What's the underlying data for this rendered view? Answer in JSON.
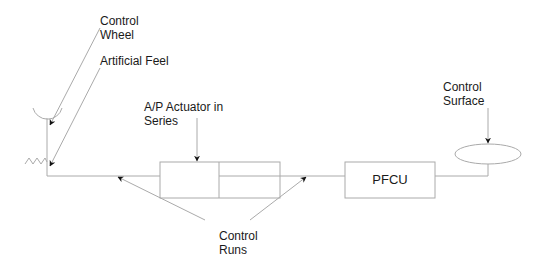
{
  "diagram": {
    "labels": {
      "control_wheel": "Control\nWheel",
      "artificial_feel": "Artificial Feel",
      "ap_actuator": "A/P Actuator in\nSeries",
      "control_surface": "Control\nSurface",
      "control_runs": "Control\nRuns",
      "pfcu": "PFCU"
    },
    "colors": {
      "line": "#a8a8a8",
      "arrow": "#111111",
      "text": "#1a1a1a",
      "background": "#ffffff"
    }
  }
}
